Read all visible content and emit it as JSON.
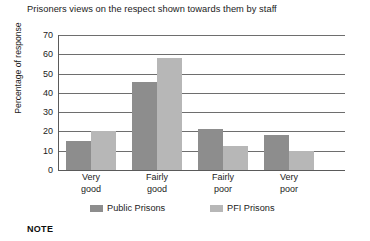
{
  "chart_data": {
    "type": "bar",
    "title": "Prisoners views on the respect shown towards them by staff",
    "xlabel": "",
    "ylabel": "Percentage of response",
    "ylim": [
      0,
      70
    ],
    "yticks": [
      0,
      10,
      20,
      30,
      40,
      50,
      60,
      70
    ],
    "grid": true,
    "legend_position": "below-axis",
    "categories": [
      "Very good",
      "Fairly good",
      "Fairly poor",
      "Very poor"
    ],
    "category_lines": [
      [
        "Very",
        "good"
      ],
      [
        "Fairly",
        "good"
      ],
      [
        "Fairly",
        "poor"
      ],
      [
        "Very",
        "poor"
      ]
    ],
    "series": [
      {
        "name": "Public Prisons",
        "color": "#8d8d8d",
        "values": [
          15,
          45.5,
          21.5,
          18
        ]
      },
      {
        "name": "PFI Prisons",
        "color": "#b7b7b7",
        "values": [
          20,
          58,
          12.5,
          10
        ]
      }
    ]
  },
  "footer": {
    "note_label": "NOTE"
  }
}
